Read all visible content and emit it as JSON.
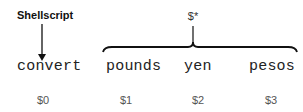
{
  "diagram": {
    "script_label": "Shellscript",
    "all_args_label": "$*",
    "words": [
      {
        "text": "convert",
        "var": "$0"
      },
      {
        "text": "pounds",
        "var": "$1"
      },
      {
        "text": "yen",
        "var": "$2"
      },
      {
        "text": "pesos",
        "var": "$3"
      }
    ],
    "colors": {
      "text": "#222222",
      "line": "#111111",
      "var": "#555555"
    }
  }
}
